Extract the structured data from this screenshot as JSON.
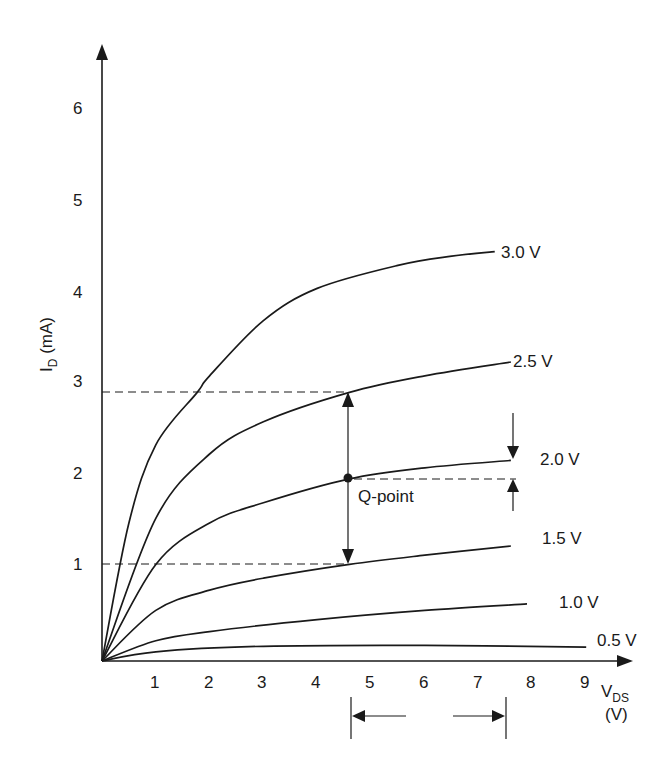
{
  "chart_data": {
    "type": "line",
    "title": "",
    "xlabel": "V_DS (V)",
    "ylabel": "I_D (mA)",
    "xlim": [
      0,
      9.8
    ],
    "ylim": [
      0,
      6.6
    ],
    "grid": false,
    "legend": "inline curve labels at right end",
    "x_ticks": [
      1,
      2,
      3,
      4,
      5,
      6,
      7,
      8,
      9
    ],
    "y_ticks": [
      1,
      2,
      3,
      4,
      5,
      6
    ],
    "series": [
      {
        "name": "3.0 V",
        "points": [
          [
            0,
            0
          ],
          [
            0.5,
            1.5
          ],
          [
            1,
            2.35
          ],
          [
            1.77,
            2.92
          ],
          [
            2,
            3.1
          ],
          [
            3,
            3.7
          ],
          [
            4,
            4.05
          ],
          [
            5.5,
            4.3
          ],
          [
            6.5,
            4.4
          ],
          [
            7.3,
            4.45
          ]
        ]
      },
      {
        "name": "2.5 V",
        "points": [
          [
            0,
            0
          ],
          [
            1,
            1.55
          ],
          [
            2,
            2.25
          ],
          [
            3,
            2.6
          ],
          [
            4.6,
            2.92
          ],
          [
            6,
            3.1
          ],
          [
            7.6,
            3.25
          ]
        ]
      },
      {
        "name": "2.0 V",
        "points": [
          [
            0,
            0
          ],
          [
            1,
            1.05
          ],
          [
            2,
            1.5
          ],
          [
            3,
            1.72
          ],
          [
            4.6,
            1.98
          ],
          [
            6,
            2.1
          ],
          [
            7.6,
            2.18
          ]
        ]
      },
      {
        "name": "1.5 V",
        "points": [
          [
            0,
            0
          ],
          [
            1,
            0.55
          ],
          [
            2,
            0.77
          ],
          [
            3,
            0.9
          ],
          [
            4.6,
            1.05
          ],
          [
            6,
            1.15
          ],
          [
            7.6,
            1.25
          ]
        ]
      },
      {
        "name": "1.0 V",
        "points": [
          [
            0,
            0
          ],
          [
            1,
            0.22
          ],
          [
            2,
            0.32
          ],
          [
            4,
            0.45
          ],
          [
            6,
            0.55
          ],
          [
            7.9,
            0.62
          ]
        ]
      },
      {
        "name": "0.5 V",
        "points": [
          [
            0,
            0
          ],
          [
            1,
            0.1
          ],
          [
            3,
            0.16
          ],
          [
            6,
            0.17
          ],
          [
            9,
            0.15
          ]
        ]
      }
    ],
    "annotations": {
      "q_point": {
        "label": "Q-point",
        "v": 4.6,
        "i": 1.98
      },
      "upper_dashed_level_mA": 2.92,
      "lower_dashed_level_mA": 1.05,
      "swing_arrow_x_V": 4.6,
      "vds_swing_range_V": [
        4.6,
        7.5
      ],
      "small_arrows_x_V": 7.6
    }
  },
  "labels": {
    "y_axis_main": "I",
    "y_axis_sub": "D",
    "y_axis_unit": " (mA)",
    "x_axis_main": "V",
    "x_axis_sub": "DS",
    "x_axis_unit": "(V)",
    "q_point": "Q-point",
    "x_ticks": [
      "1",
      "2",
      "3",
      "4",
      "5",
      "6",
      "7",
      "8",
      "9"
    ],
    "y_ticks": [
      "1",
      "2",
      "3",
      "4",
      "5",
      "6"
    ],
    "curves": [
      "3.0 V",
      "2.5 V",
      "2.0 V",
      "1.5 V",
      "1.0 V",
      "0.5 V"
    ]
  }
}
